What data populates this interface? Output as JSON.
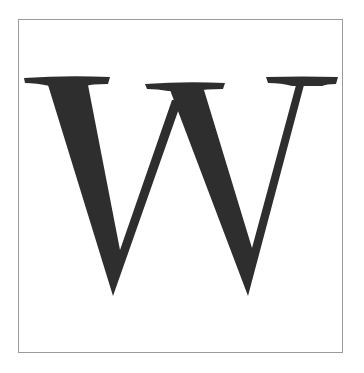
{
  "glyph": {
    "letter": "W",
    "color": "#2e2e2e",
    "frame_color": "#9a9a9a",
    "background": "#ffffff"
  }
}
